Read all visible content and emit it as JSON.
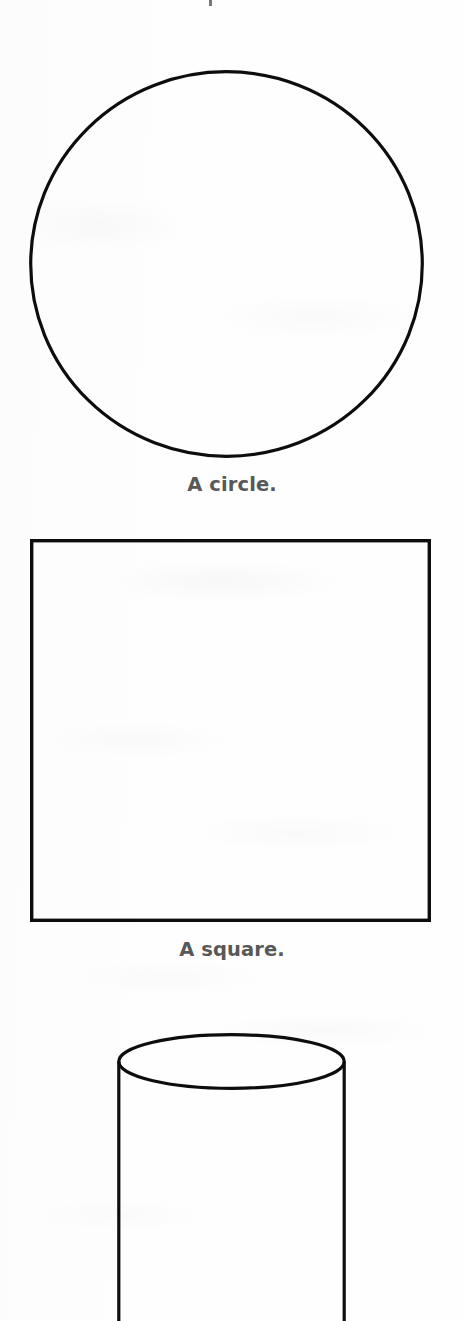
{
  "page": {
    "width": 464,
    "height": 1321,
    "background_color": "#fefefe",
    "ink_color": "#0d0d0d",
    "caption_color": "#585858",
    "kind": "scanned-book-figure-page"
  },
  "artifacts": {
    "top_clipped_mark": "•"
  },
  "figures": [
    {
      "id": "circle",
      "shape": "circle",
      "caption": "A circle.",
      "geometry": {
        "left": 29,
        "top": 70,
        "width": 395,
        "height": 388,
        "stroke_width": 3.2
      },
      "caption_top": 473
    },
    {
      "id": "square",
      "shape": "square",
      "caption": "A square.",
      "geometry": {
        "left": 30,
        "top": 539,
        "width": 401,
        "height": 383,
        "stroke_width": 3.4
      },
      "caption_top": 938
    },
    {
      "id": "cylinder",
      "shape": "cylinder",
      "caption": "",
      "geometry": {
        "left": 117,
        "top": 1033,
        "width": 229,
        "ellipse_height": 57,
        "body_height": 288,
        "stroke_width": 3.2,
        "clipped_at_page_bottom": true
      },
      "caption_top": null
    }
  ]
}
